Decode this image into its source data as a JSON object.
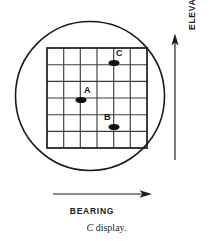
{
  "figure": {
    "caption_emphasis": "C",
    "caption_text": " display.",
    "display_type": "C display",
    "scope_shape": "circle",
    "colors": {
      "ink": "#1a1a1a",
      "grid_line": "#3c3c3c",
      "grid_border": "#1a1a1a",
      "blip": "#111111",
      "background": "#ffffff"
    }
  },
  "axes": {
    "vertical": {
      "label": "ELEVATION ANGLE",
      "arrow_direction": "up",
      "icon": "arrow-up-icon"
    },
    "horizontal": {
      "label": "BEARING",
      "arrow_direction": "right",
      "icon": "arrow-right-icon"
    }
  },
  "grid": {
    "columns": 6,
    "rows": 6,
    "x_left": 47,
    "x_right": 147,
    "y_top": 48,
    "y_bottom": 148
  },
  "scope": {
    "center_x": 90,
    "center_y": 96,
    "radius": 75
  },
  "blips": [
    {
      "id": "A",
      "label": "A",
      "x": 81,
      "y": 100,
      "rx": 5.5,
      "ry": 3.0,
      "bearing_cell": 2,
      "elevation_cell": 3
    },
    {
      "id": "B",
      "label": "B",
      "x": 114,
      "y": 127,
      "rx": 5.5,
      "ry": 3.0,
      "bearing_cell": 4,
      "elevation_cell": 5
    },
    {
      "id": "C",
      "label": "C",
      "x": 114,
      "y": 63,
      "rx": 5.5,
      "ry": 3.0,
      "bearing_cell": 4,
      "elevation_cell": 1
    }
  ]
}
